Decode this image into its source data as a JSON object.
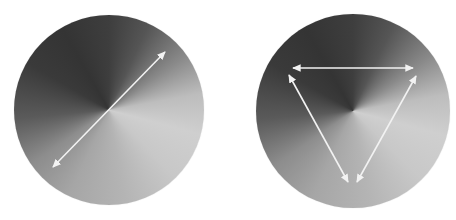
{
  "figure": {
    "panels": [
      {
        "id": "left",
        "shape": "disk",
        "fill": "conic grayscale gradient",
        "arrows": [
          {
            "type": "double-headed",
            "from": [
              53,
              167
            ],
            "to": [
              165,
              52
            ]
          }
        ]
      },
      {
        "id": "right",
        "shape": "disk",
        "fill": "conic grayscale gradient",
        "arrows": [
          {
            "type": "double-headed",
            "from": [
              293,
              68
            ],
            "to": [
              413,
              68
            ]
          },
          {
            "type": "double-headed",
            "from": [
              289,
              75
            ],
            "to": [
              348,
              182
            ]
          },
          {
            "type": "double-headed",
            "from": [
              416,
              76
            ],
            "to": [
              357,
              182
            ]
          }
        ]
      }
    ],
    "colors": {
      "arrow": "#f2f2f2",
      "background": "#ffffff"
    }
  }
}
